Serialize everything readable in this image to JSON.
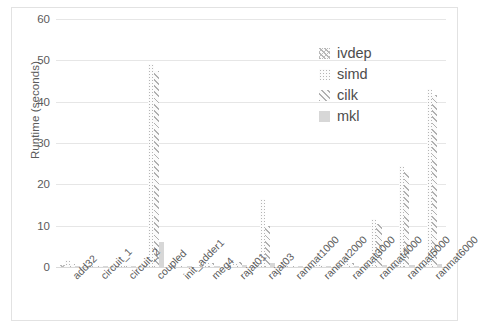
{
  "chart_data": {
    "type": "bar",
    "title": "",
    "xlabel": "",
    "ylabel": "Runtime (seconds)",
    "ylim": [
      0,
      60
    ],
    "yticks": [
      0,
      10,
      20,
      30,
      40,
      50,
      60
    ],
    "grid": true,
    "legend_position": "upper-right",
    "categories": [
      "add32",
      "circuit_1",
      "circuit_2",
      "coupled",
      "init_adder1",
      "meg4",
      "rajat01",
      "rajat03",
      "ranmat1000",
      "ranmat2000",
      "ranmat3000",
      "ranmat4000",
      "ranmat5000",
      "ranmat6000"
    ],
    "series": [
      {
        "name": "ivdep",
        "pattern": "crosshatch",
        "values": [
          0.4,
          0.1,
          0.3,
          0.5,
          0.2,
          0.4,
          0.5,
          0.6,
          0.2,
          0.3,
          0.4,
          0.5,
          0.6,
          0.7
        ]
      },
      {
        "name": "simd",
        "pattern": "dotted",
        "values": [
          1.7,
          0.2,
          0.5,
          49.0,
          0.2,
          1.2,
          1.0,
          16.5,
          0.3,
          0.8,
          2.5,
          11.5,
          24.5,
          43.0
        ]
      },
      {
        "name": "cilk",
        "pattern": "diagonal",
        "values": [
          0.8,
          0.2,
          0.6,
          47.5,
          0.3,
          0.9,
          1.3,
          10.0,
          0.3,
          0.5,
          1.0,
          10.5,
          23.0,
          41.5
        ]
      },
      {
        "name": "mkl",
        "pattern": "solid",
        "values": [
          0.3,
          0.1,
          0.2,
          6.0,
          0.2,
          0.3,
          0.4,
          1.0,
          0.2,
          0.2,
          0.3,
          0.5,
          0.6,
          0.8
        ]
      }
    ]
  },
  "legend": {
    "items": [
      {
        "label": "ivdep",
        "series_key": "ivdep"
      },
      {
        "label": "simd",
        "series_key": "simd"
      },
      {
        "label": "cilk",
        "series_key": "cilk"
      },
      {
        "label": "mkl",
        "series_key": "mkl"
      }
    ]
  },
  "colors": {
    "grid": "#e6e6e6",
    "axis_text": "#5b5b5b",
    "legend_text": "#4d4d4d",
    "mkl_fill": "#d7d7d7",
    "pattern_ink": "#b5b5b5",
    "frame_border": "#e2e2e2"
  }
}
